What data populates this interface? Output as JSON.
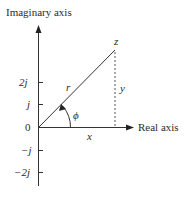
{
  "diagram": {
    "axes": {
      "vertical_label": "Imaginary axis",
      "horizontal_label": "Real axis",
      "origin_label": "0"
    },
    "imaginary_ticks": [
      {
        "label": "2j",
        "value": 2
      },
      {
        "label": "j",
        "value": 1
      },
      {
        "label": "0",
        "value": 0
      },
      {
        "label": "−j",
        "value": -1
      },
      {
        "label": "−2j",
        "value": -2
      }
    ],
    "point": {
      "label": "z"
    },
    "segments": {
      "magnitude_label": "r",
      "real_part_label": "x",
      "imag_part_label": "y",
      "angle_label": "ϕ"
    },
    "colors": {
      "line": "#333333",
      "text": "#2a2a2a",
      "background": "#ffffff"
    }
  }
}
